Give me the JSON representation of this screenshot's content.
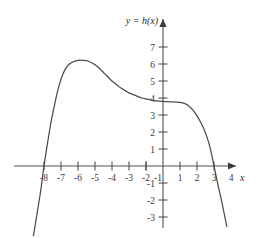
{
  "figure": {
    "background_color": "#ffffff",
    "curve_color": "#4d4a49",
    "axis_color": "#54504f",
    "text_color": "#3b3838",
    "curve_label": "y = h(x)",
    "x_axis_name": "x"
  },
  "chart_data": {
    "type": "line",
    "title": "",
    "subtitle": "",
    "xlabel": "x",
    "ylabel": "",
    "annotations": [
      "y = h(x)"
    ],
    "legend": [],
    "legend_position": "none",
    "grid": false,
    "xlim": [
      -8.8,
      4.6
    ],
    "ylim": [
      -3.6,
      7.6
    ],
    "xticks": [
      -8,
      -7,
      -6,
      -5,
      -4,
      -3,
      -2,
      -1,
      1,
      2,
      3,
      4
    ],
    "xticklabels": [
      "-8",
      "-7",
      "-6",
      "-5",
      "-4",
      "-3",
      "-2",
      "-1",
      "1",
      "2",
      "3",
      "4"
    ],
    "yticks": [
      -3,
      -2,
      -1,
      1,
      2,
      3,
      4,
      5,
      6,
      7
    ],
    "yticklabels": [
      "-3",
      "-2",
      "-1",
      "1",
      "2",
      "3",
      "4",
      "5",
      "6",
      "7"
    ],
    "x_axis_at_y": 0,
    "y_axis_at_x": 0,
    "axis_arrows": [
      "x-positive",
      "y-positive"
    ],
    "roots": [
      -7,
      3
    ],
    "local_maximum": {
      "x": -4.5,
      "y": 6.2
    },
    "inflection_plateau": {
      "x_range": [
        0,
        1
      ],
      "y": 3.8
    },
    "series": [
      {
        "name": "h(x)",
        "color": "#4d4a49",
        "x": [
          -7.62,
          -7.4,
          -7.2,
          -7.0,
          -6.8,
          -6.6,
          -6.4,
          -6.2,
          -6.0,
          -5.75,
          -5.5,
          -5.25,
          -5.0,
          -4.75,
          -4.5,
          -4.25,
          -4.0,
          -3.75,
          -3.5,
          -3.25,
          -3.0,
          -2.75,
          -2.5,
          -2.25,
          -2.0,
          -1.75,
          -1.5,
          -1.25,
          -1.0,
          -0.75,
          -0.5,
          -0.25,
          0.0,
          0.25,
          0.5,
          0.75,
          1.0,
          1.25,
          1.5,
          1.75,
          2.0,
          2.25,
          2.5,
          2.75,
          3.0,
          3.2,
          3.4,
          3.6,
          3.75
        ],
        "y": [
          -4.1,
          -2.75,
          -1.5,
          0.0,
          1.3,
          2.5,
          3.5,
          4.4,
          5.1,
          5.7,
          6.0,
          6.15,
          6.22,
          6.22,
          6.2,
          6.1,
          5.95,
          5.75,
          5.5,
          5.25,
          5.0,
          4.8,
          4.6,
          4.45,
          4.3,
          4.2,
          4.1,
          4.0,
          3.95,
          3.9,
          3.85,
          3.82,
          3.8,
          3.78,
          3.77,
          3.76,
          3.74,
          3.68,
          3.55,
          3.3,
          2.95,
          2.5,
          1.95,
          1.15,
          0.0,
          -0.95,
          -1.85,
          -2.8,
          -3.55
        ]
      }
    ]
  }
}
